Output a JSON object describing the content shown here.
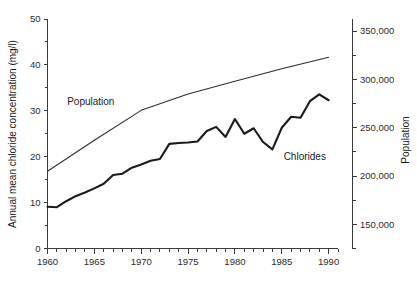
{
  "chart_data": {
    "type": "line",
    "title": "",
    "xlabel": "",
    "ylabel": "Annual mean chloride concentration (mg/l)",
    "y2label": "Population",
    "xlim": [
      1960,
      1991
    ],
    "ylim": [
      0,
      50
    ],
    "y2lim": [
      125000,
      362500
    ],
    "grid": false,
    "legend": "inline-annotations",
    "x_ticks": [
      1960,
      1965,
      1970,
      1975,
      1980,
      1985,
      1990
    ],
    "x_tick_labels": [
      "1960",
      "1965",
      "1970",
      "1975",
      "1980",
      "1985",
      "1990"
    ],
    "x_minor_tick_interval": 1,
    "y_ticks": [
      0,
      10,
      20,
      30,
      40,
      50
    ],
    "y_tick_labels": [
      "0",
      "10",
      "20",
      "30",
      "40",
      "50"
    ],
    "y_minor_tick_interval": 5,
    "y2_ticks": [
      150000,
      200000,
      250000,
      300000,
      350000
    ],
    "y2_tick_labels": [
      "150,000",
      "200,000",
      "250,000",
      "300,000",
      "350,000"
    ],
    "y2_minor_tick_interval": 25000,
    "series": [
      {
        "name": "Chlorides",
        "axis": "left",
        "units": "mg/l",
        "label_x": 1985.2,
        "label_y": 19.2,
        "x": [
          1960,
          1961,
          1962,
          1963,
          1964,
          1965,
          1966,
          1967,
          1968,
          1969,
          1970,
          1971,
          1972,
          1973,
          1974,
          1975,
          1976,
          1977,
          1978,
          1979,
          1980,
          1981,
          1982,
          1983,
          1984,
          1985,
          1986,
          1987,
          1988,
          1989,
          1990
        ],
        "values": [
          9.1,
          9.0,
          10.3,
          11.4,
          12.2,
          13.1,
          14.1,
          16.0,
          16.3,
          17.6,
          18.3,
          19.1,
          19.5,
          22.8,
          23.0,
          23.1,
          23.3,
          25.6,
          26.5,
          24.3,
          28.2,
          25.0,
          26.2,
          23.2,
          21.6,
          26.3,
          28.7,
          28.5,
          32.1,
          33.6,
          32.3
        ]
      },
      {
        "name": "Population",
        "axis": "right",
        "units": "people",
        "label_x": 1962.1,
        "label_y": 31.3,
        "x": [
          1960,
          1965,
          1970,
          1975,
          1980,
          1985,
          1990
        ],
        "values": [
          205000,
          237000,
          268000,
          285000,
          298000,
          311000,
          323000
        ],
        "values_left_axis_equivalent": [
          17.0,
          23.8,
          30.4,
          34.1,
          36.8,
          39.6,
          42.1
        ]
      }
    ],
    "annotations": [
      {
        "text": "Population",
        "x": 1962.1,
        "y": 31.3
      },
      {
        "text": "Chlorides",
        "x": 1985.2,
        "y": 19.2
      }
    ]
  },
  "axes": {
    "left_title": "Annual mean chloride concentration (mg/l)",
    "right_title": "Population"
  }
}
